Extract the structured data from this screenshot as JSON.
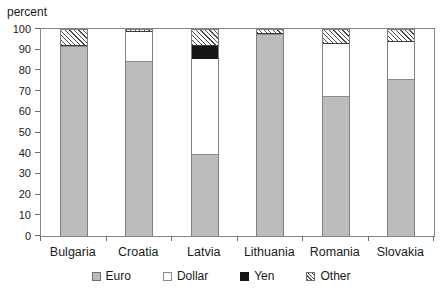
{
  "title": "percent",
  "chart_data": {
    "type": "bar",
    "stacked": true,
    "title": "",
    "ylabel": "percent",
    "xlabel": "",
    "categories": [
      "Bulgaria",
      "Croatia",
      "Latvia",
      "Lithuania",
      "Romania",
      "Slovakia"
    ],
    "series": [
      {
        "name": "Euro",
        "style": "euro",
        "values": [
          92,
          85,
          40,
          98,
          68,
          76
        ]
      },
      {
        "name": "Dollar",
        "style": "dollar",
        "values": [
          0,
          14,
          46,
          0,
          25,
          18
        ]
      },
      {
        "name": "Yen",
        "style": "yen",
        "values": [
          0,
          0,
          6,
          0,
          0,
          0
        ]
      },
      {
        "name": "Other",
        "style": "other",
        "values": [
          8,
          1,
          8,
          2,
          7,
          6
        ]
      }
    ],
    "ylim": [
      0,
      100
    ],
    "yticks": [
      0,
      10,
      20,
      30,
      40,
      50,
      60,
      70,
      80,
      90,
      100
    ],
    "grid": false,
    "legend_position": "bottom",
    "colors": {
      "euro_fill": "#bcbcbc",
      "dollar_fill": "#ffffff",
      "yen_fill": "#161616",
      "hatch_line": "#4d4d4d",
      "axis": "#858585",
      "text": "#1a1a1a"
    }
  }
}
